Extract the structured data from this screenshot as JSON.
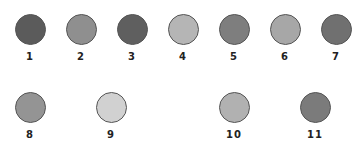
{
  "swatches": [
    {
      "label": "1",
      "color": "#5b5b5b",
      "cx": 30,
      "cy": 29
    },
    {
      "label": "2",
      "color": "#8f8f8f",
      "cx": 81,
      "cy": 29
    },
    {
      "label": "3",
      "color": "#5f5f5f",
      "cx": 132,
      "cy": 29
    },
    {
      "label": "4",
      "color": "#b5b5b5",
      "cx": 183,
      "cy": 29
    },
    {
      "label": "5",
      "color": "#7e7e7e",
      "cx": 234,
      "cy": 29
    },
    {
      "label": "6",
      "color": "#a7a7a7",
      "cx": 285,
      "cy": 29
    },
    {
      "label": "7",
      "color": "#707070",
      "cx": 336,
      "cy": 29
    },
    {
      "label": "8",
      "color": "#949494",
      "cx": 30,
      "cy": 107
    },
    {
      "label": "9",
      "color": "#d1d1d1",
      "cx": 111,
      "cy": 107
    },
    {
      "label": "10",
      "color": "#b1b1b1",
      "cx": 234,
      "cy": 107
    },
    {
      "label": "11",
      "color": "#7b7b7b",
      "cx": 315,
      "cy": 107
    }
  ]
}
